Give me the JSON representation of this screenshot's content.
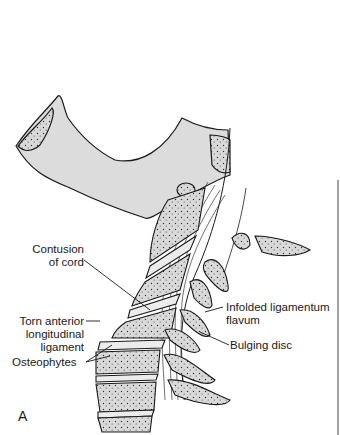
{
  "figure": {
    "panel_letter": "A",
    "colors": {
      "bone_fill": "#d9d9d9",
      "outline": "#1a1a1a",
      "background": "#ffffff"
    },
    "labels": {
      "contusion": [
        "Contusion",
        "of cord"
      ],
      "torn_ligament": [
        "Torn anterior",
        "longitudinal",
        "ligament"
      ],
      "osteophytes": "Osteophytes",
      "infolded": [
        "Infolded ligamentum",
        "flavum"
      ],
      "bulging_disc": "Bulging disc"
    }
  }
}
